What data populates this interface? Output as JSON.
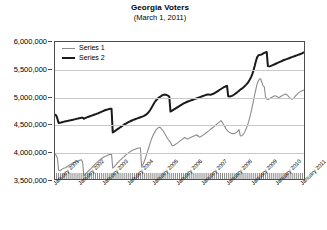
{
  "chart_data": {
    "type": "line",
    "title": "Georgia Voters",
    "subtitle": "(March 1, 2011)",
    "xlabel": "",
    "ylabel": "",
    "ylim": [
      3500000,
      6000000
    ],
    "ytick_labels": [
      "6,000,000",
      "5,500,000",
      "5,000,000",
      "4,500,000",
      "4,000,000",
      "3,500,000"
    ],
    "ytick_values": [
      6000000,
      5500000,
      5000000,
      4500000,
      4000000,
      3500000
    ],
    "grid": true,
    "legend_position": "top-left",
    "xlim": [
      "January 2001",
      "March 2011"
    ],
    "xtick_labels": [
      "January 2001",
      "January 2002",
      "January 2003",
      "January 2004",
      "January 2005",
      "January 2006",
      "January 2007",
      "January 2008",
      "January 2009",
      "January 2010",
      "January 2011"
    ],
    "x_minor_ticks": "monthly",
    "series": [
      {
        "name": "Series 1",
        "color": "#8c8c8c",
        "width": 1.1,
        "values": [
          3960000,
          3930000,
          3880000,
          3660000,
          3650000,
          3665000,
          3680000,
          3695000,
          3700000,
          3710000,
          3725000,
          3740000,
          3755000,
          3770000,
          3780000,
          3795000,
          3805000,
          3815000,
          3822000,
          3830000,
          3838000,
          3845000,
          3850000,
          3800000,
          3560000,
          3580000,
          3605000,
          3630000,
          3650000,
          3670000,
          3690000,
          3715000,
          3740000,
          3762000,
          3785000,
          3805000,
          3825000,
          3845000,
          3862000,
          3878000,
          3892000,
          3905000,
          3915000,
          3925000,
          3935000,
          3945000,
          3950000,
          3955000,
          3700000,
          3718000,
          3742000,
          3768000,
          3792000,
          3815000,
          3838000,
          3860000,
          3882000,
          3900000,
          3920000,
          3940000,
          3958000,
          3975000,
          3990000,
          4005000,
          4018000,
          4030000,
          4040000,
          4048000,
          4055000,
          4060000,
          4065000,
          4068000,
          3720000,
          3760000,
          3810000,
          3870000,
          3940000,
          4010000,
          4080000,
          4150000,
          4215000,
          4270000,
          4320000,
          4360000,
          4395000,
          4420000,
          4438000,
          4445000,
          4430000,
          4400000,
          4375000,
          4340000,
          4300000,
          4260000,
          4225000,
          4195000,
          4170000,
          4120000,
          4105000,
          4115000,
          4130000,
          4145000,
          4160000,
          4178000,
          4195000,
          4210000,
          4228000,
          4245000,
          4260000,
          4240000,
          4228000,
          4238000,
          4250000,
          4262000,
          4272000,
          4282000,
          4290000,
          4298000,
          4305000,
          4285000,
          4265000,
          4272000,
          4285000,
          4300000,
          4315000,
          4330000,
          4348000,
          4365000,
          4382000,
          4400000,
          4418000,
          4435000,
          4452000,
          4470000,
          4490000,
          4510000,
          4530000,
          4548000,
          4565000,
          4540000,
          4500000,
          4460000,
          4420000,
          4390000,
          4370000,
          4352000,
          4340000,
          4332000,
          4328000,
          4330000,
          4340000,
          4355000,
          4375000,
          4400000,
          4290000,
          4285000,
          4300000,
          4330000,
          4370000,
          4420000,
          4480000,
          4550000,
          4630000,
          4720000,
          4820000,
          4930000,
          5040000,
          5140000,
          5230000,
          5290000,
          5325000,
          5330000,
          5260000,
          5200000,
          5180000,
          5000000,
          4960000,
          4952000,
          4960000,
          4975000,
          4988000,
          5000000,
          5012000,
          5020000,
          5010000,
          4995000,
          4985000,
          4995000,
          5010000,
          5022000,
          5035000,
          5045000,
          5050000,
          5035000,
          5010000,
          4985000,
          4965000,
          4955000,
          4968000,
          4990000,
          5015000,
          5040000,
          5062000,
          5080000,
          5095000,
          5108000,
          5118000,
          5125000
        ]
      },
      {
        "name": "Series 2",
        "color": "#1a1a1a",
        "width": 2.0,
        "values": [
          4680000,
          4660000,
          4600000,
          4520000,
          4525000,
          4530000,
          4536000,
          4542000,
          4548000,
          4552000,
          4558000,
          4562000,
          4568000,
          4572000,
          4578000,
          4582000,
          4588000,
          4592000,
          4598000,
          4602000,
          4608000,
          4612000,
          4616000,
          4620000,
          4600000,
          4610000,
          4620000,
          4628000,
          4636000,
          4644000,
          4652000,
          4660000,
          4668000,
          4676000,
          4684000,
          4692000,
          4700000,
          4710000,
          4720000,
          4730000,
          4740000,
          4750000,
          4758000,
          4764000,
          4770000,
          4776000,
          4780000,
          4782000,
          4350000,
          4362000,
          4378000,
          4394000,
          4410000,
          4425000,
          4440000,
          4455000,
          4470000,
          4485000,
          4500000,
          4512000,
          4524000,
          4536000,
          4548000,
          4558000,
          4568000,
          4578000,
          4586000,
          4594000,
          4602000,
          4610000,
          4618000,
          4626000,
          4634000,
          4642000,
          4652000,
          4664000,
          4680000,
          4700000,
          4725000,
          4755000,
          4790000,
          4830000,
          4870000,
          4905000,
          4935000,
          4960000,
          4980000,
          4995000,
          5010000,
          5025000,
          5035000,
          5040000,
          5038000,
          5030000,
          5020000,
          5005000,
          4730000,
          4742000,
          4756000,
          4770000,
          4784000,
          4798000,
          4812000,
          4826000,
          4840000,
          4854000,
          4866000,
          4878000,
          4890000,
          4900000,
          4910000,
          4918000,
          4926000,
          4934000,
          4942000,
          4950000,
          4958000,
          4966000,
          4974000,
          4982000,
          4990000,
          4998000,
          5006000,
          5014000,
          5022000,
          5030000,
          5038000,
          5042000,
          5040000,
          5036000,
          5042000,
          5050000,
          5060000,
          5072000,
          5086000,
          5100000,
          5114000,
          5128000,
          5142000,
          5156000,
          5170000,
          5182000,
          5192000,
          5200000,
          5010000,
          5005000,
          5008000,
          5016000,
          5028000,
          5042000,
          5058000,
          5075000,
          5092000,
          5110000,
          5128000,
          5145000,
          5162000,
          5180000,
          5200000,
          5222000,
          5248000,
          5278000,
          5315000,
          5360000,
          5415000,
          5480000,
          5560000,
          5650000,
          5720000,
          5755000,
          5765000,
          5768000,
          5775000,
          5790000,
          5800000,
          5810000,
          5818000,
          5560000,
          5555000,
          5560000,
          5568000,
          5578000,
          5588000,
          5598000,
          5608000,
          5618000,
          5628000,
          5638000,
          5648000,
          5658000,
          5668000,
          5676000,
          5684000,
          5692000,
          5700000,
          5708000,
          5716000,
          5724000,
          5732000,
          5740000,
          5748000,
          5756000,
          5764000,
          5772000,
          5780000,
          5790000,
          5802000,
          5818000
        ]
      }
    ]
  }
}
